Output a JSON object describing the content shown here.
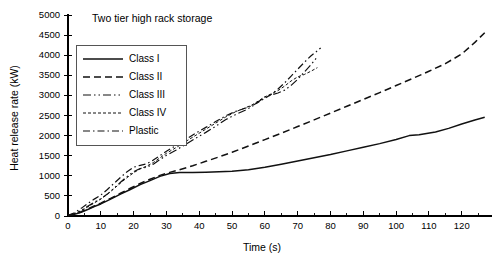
{
  "chart_data": {
    "type": "line",
    "title": "Two tier high rack storage",
    "xlabel": "Time (s)",
    "ylabel": "Heat release rate (kW)",
    "xlim": [
      0,
      128
    ],
    "ylim": [
      0,
      5000
    ],
    "xticks": [
      0,
      10,
      20,
      30,
      40,
      50,
      60,
      70,
      80,
      90,
      100,
      110,
      120
    ],
    "xticklabels": [
      "0",
      "10",
      "20",
      "30",
      "40",
      "50",
      "60",
      "70",
      "80",
      "90",
      "100",
      "110",
      "120"
    ],
    "x_minor_step": 5,
    "yticks": [
      0,
      500,
      1000,
      1500,
      2000,
      2500,
      3000,
      3500,
      4000,
      4500,
      5000
    ],
    "yticklabels": [
      "0",
      "500",
      "1000",
      "1500",
      "2000",
      "2500",
      "3000",
      "3500",
      "4000",
      "4500",
      "5000"
    ],
    "grid": false,
    "legend_position": "upper left",
    "series": [
      {
        "name": "Class I",
        "style": "solid",
        "dash": "none",
        "width": 1.5,
        "points": [
          [
            0,
            10
          ],
          [
            2,
            40
          ],
          [
            4,
            95
          ],
          [
            6,
            160
          ],
          [
            8,
            235
          ],
          [
            10,
            300
          ],
          [
            13,
            420
          ],
          [
            16,
            545
          ],
          [
            19,
            660
          ],
          [
            22,
            780
          ],
          [
            25,
            880
          ],
          [
            28,
            985
          ],
          [
            31,
            1055
          ],
          [
            34,
            1080
          ],
          [
            38,
            1085
          ],
          [
            42,
            1090
          ],
          [
            46,
            1100
          ],
          [
            50,
            1115
          ],
          [
            55,
            1150
          ],
          [
            60,
            1215
          ],
          [
            65,
            1290
          ],
          [
            70,
            1370
          ],
          [
            75,
            1450
          ],
          [
            80,
            1530
          ],
          [
            85,
            1620
          ],
          [
            90,
            1710
          ],
          [
            95,
            1800
          ],
          [
            100,
            1905
          ],
          [
            104,
            2000
          ],
          [
            107,
            2020
          ],
          [
            112,
            2090
          ],
          [
            116,
            2180
          ],
          [
            120,
            2290
          ],
          [
            124,
            2390
          ],
          [
            127,
            2455
          ]
        ]
      },
      {
        "name": "Class II",
        "style": "dashed",
        "dash": "7,4",
        "width": 1.5,
        "points": [
          [
            0,
            10
          ],
          [
            2,
            45
          ],
          [
            4,
            105
          ],
          [
            6,
            175
          ],
          [
            8,
            250
          ],
          [
            10,
            320
          ],
          [
            13,
            440
          ],
          [
            16,
            565
          ],
          [
            19,
            690
          ],
          [
            22,
            810
          ],
          [
            25,
            915
          ],
          [
            28,
            1010
          ],
          [
            31,
            1085
          ],
          [
            34,
            1150
          ],
          [
            38,
            1250
          ],
          [
            42,
            1360
          ],
          [
            46,
            1470
          ],
          [
            50,
            1585
          ],
          [
            55,
            1740
          ],
          [
            60,
            1900
          ],
          [
            65,
            2060
          ],
          [
            70,
            2225
          ],
          [
            75,
            2390
          ],
          [
            80,
            2560
          ],
          [
            85,
            2730
          ],
          [
            90,
            2900
          ],
          [
            95,
            3070
          ],
          [
            100,
            3245
          ],
          [
            105,
            3420
          ],
          [
            110,
            3600
          ],
          [
            115,
            3790
          ],
          [
            120,
            4030
          ],
          [
            124,
            4320
          ],
          [
            127,
            4560
          ]
        ]
      },
      {
        "name": "Class III",
        "style": "dash-dot-dot",
        "dash": "8,3,1.5,3,1.5,3",
        "width": 1.2,
        "points": [
          [
            0,
            15
          ],
          [
            2,
            60
          ],
          [
            4,
            140
          ],
          [
            6,
            240
          ],
          [
            8,
            340
          ],
          [
            10,
            430
          ],
          [
            12,
            545
          ],
          [
            14,
            690
          ],
          [
            16,
            840
          ],
          [
            18,
            980
          ],
          [
            20,
            1105
          ],
          [
            22,
            1180
          ],
          [
            24,
            1215
          ],
          [
            26,
            1290
          ],
          [
            28,
            1400
          ],
          [
            30,
            1510
          ],
          [
            33,
            1640
          ],
          [
            36,
            1790
          ],
          [
            39,
            1940
          ],
          [
            42,
            2080
          ],
          [
            45,
            2230
          ],
          [
            48,
            2395
          ],
          [
            51,
            2520
          ],
          [
            54,
            2630
          ],
          [
            56,
            2720
          ],
          [
            58,
            2840
          ],
          [
            60,
            2960
          ],
          [
            62,
            3010
          ],
          [
            64,
            3060
          ],
          [
            66,
            3130
          ],
          [
            68,
            3250
          ],
          [
            70,
            3400
          ],
          [
            72,
            3580
          ],
          [
            74,
            3760
          ],
          [
            76,
            3960
          ]
        ]
      },
      {
        "name": "Class IV",
        "style": "fine-dotted-dash",
        "dash": "3,2",
        "width": 1.0,
        "points": [
          [
            0,
            15
          ],
          [
            2,
            55
          ],
          [
            4,
            130
          ],
          [
            6,
            225
          ],
          [
            8,
            325
          ],
          [
            10,
            420
          ],
          [
            12,
            540
          ],
          [
            14,
            680
          ],
          [
            16,
            820
          ],
          [
            18,
            955
          ],
          [
            20,
            1075
          ],
          [
            22,
            1175
          ],
          [
            24,
            1240
          ],
          [
            26,
            1330
          ],
          [
            28,
            1445
          ],
          [
            30,
            1560
          ],
          [
            33,
            1705
          ],
          [
            36,
            1860
          ],
          [
            39,
            2010
          ],
          [
            42,
            2160
          ],
          [
            45,
            2310
          ],
          [
            48,
            2460
          ],
          [
            51,
            2590
          ],
          [
            54,
            2690
          ],
          [
            56,
            2760
          ],
          [
            58,
            2860
          ],
          [
            60,
            2965
          ],
          [
            62,
            3040
          ],
          [
            64,
            3120
          ],
          [
            66,
            3230
          ],
          [
            68,
            3360
          ],
          [
            70,
            3460
          ],
          [
            72,
            3520
          ],
          [
            74,
            3600
          ],
          [
            76,
            3690
          ]
        ]
      },
      {
        "name": "Plastic",
        "style": "dash-dot",
        "dash": "7,3,1.5,3",
        "width": 1.2,
        "points": [
          [
            0,
            20
          ],
          [
            2,
            80
          ],
          [
            4,
            190
          ],
          [
            6,
            310
          ],
          [
            8,
            420
          ],
          [
            10,
            520
          ],
          [
            12,
            660
          ],
          [
            14,
            810
          ],
          [
            16,
            960
          ],
          [
            18,
            1100
          ],
          [
            20,
            1215
          ],
          [
            22,
            1260
          ],
          [
            24,
            1300
          ],
          [
            26,
            1390
          ],
          [
            28,
            1500
          ],
          [
            30,
            1610
          ],
          [
            33,
            1760
          ],
          [
            36,
            1915
          ],
          [
            39,
            2065
          ],
          [
            42,
            2205
          ],
          [
            45,
            2350
          ],
          [
            48,
            2490
          ],
          [
            51,
            2600
          ],
          [
            54,
            2680
          ],
          [
            56,
            2740
          ],
          [
            58,
            2830
          ],
          [
            60,
            2930
          ],
          [
            62,
            3030
          ],
          [
            64,
            3160
          ],
          [
            66,
            3310
          ],
          [
            68,
            3480
          ],
          [
            70,
            3650
          ],
          [
            72,
            3820
          ],
          [
            74,
            3980
          ],
          [
            76,
            4110
          ],
          [
            77,
            4180
          ]
        ]
      }
    ]
  },
  "legend": {
    "entries": [
      {
        "label": "Class I"
      },
      {
        "label": "Class II"
      },
      {
        "label": "Class III"
      },
      {
        "label": "Class IV"
      },
      {
        "label": "Plastic"
      }
    ]
  }
}
